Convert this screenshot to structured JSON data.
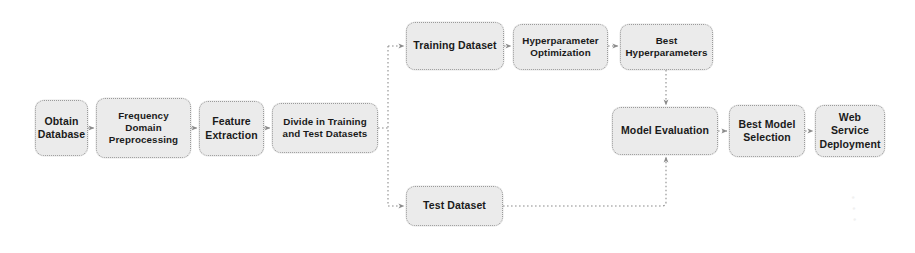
{
  "diagram": {
    "type": "flowchart",
    "canvas": {
      "width": 915,
      "height": 253
    },
    "style": {
      "node_fill": "#ebebeb",
      "node_border": "#9a9a9a",
      "edge_color": "#8c8c8c",
      "text_color": "#1a1a1a",
      "background": "#ffffff",
      "edge_style": "dotted",
      "node_shape": "rounded-rectangle"
    },
    "nodes": [
      {
        "id": "obtain-database",
        "label": "Obtain\nDatabase",
        "x": 35,
        "y": 100,
        "w": 53,
        "h": 56
      },
      {
        "id": "frequency-domain-preprocessing",
        "label": "Frequency\nDomain\nPreprocessing",
        "x": 96,
        "y": 98,
        "w": 95,
        "h": 60
      },
      {
        "id": "feature-extraction",
        "label": "Feature\nExtraction",
        "x": 199,
        "y": 101,
        "w": 65,
        "h": 55
      },
      {
        "id": "divide-in-training-and-test-datasets",
        "label": "Divide in Training\nand Test Datasets",
        "x": 272,
        "y": 103,
        "w": 106,
        "h": 50
      },
      {
        "id": "training-dataset",
        "label": "Training Dataset",
        "x": 406,
        "y": 22,
        "w": 98,
        "h": 48
      },
      {
        "id": "hyperparameter-optimization",
        "label": "Hyperparameter\nOptimization",
        "x": 513,
        "y": 24,
        "w": 95,
        "h": 46
      },
      {
        "id": "best-hyperparameters",
        "label": "Best\nHyperparameters",
        "x": 620,
        "y": 24,
        "w": 93,
        "h": 46
      },
      {
        "id": "model-evaluation",
        "label": "Model Evaluation",
        "x": 612,
        "y": 107,
        "w": 106,
        "h": 48
      },
      {
        "id": "best-model-selection",
        "label": "Best Model\nSelection",
        "x": 729,
        "y": 105,
        "w": 76,
        "h": 52
      },
      {
        "id": "web-service-deployment",
        "label": "Web Service\nDeployment",
        "x": 815,
        "y": 105,
        "w": 70,
        "h": 52
      },
      {
        "id": "test-dataset",
        "label": "Test Dataset",
        "x": 406,
        "y": 186,
        "w": 97,
        "h": 40
      }
    ],
    "edges": [
      {
        "id": "edge-obtain-to-frequency",
        "from": "obtain-database",
        "to": "frequency-domain-preprocessing",
        "kind": "straight"
      },
      {
        "id": "edge-frequency-to-feature",
        "from": "frequency-domain-preprocessing",
        "to": "feature-extraction",
        "kind": "straight"
      },
      {
        "id": "edge-feature-to-divide",
        "from": "feature-extraction",
        "to": "divide-in-training-and-test-datasets",
        "kind": "straight"
      },
      {
        "id": "edge-divide-to-training",
        "from": "divide-in-training-and-test-datasets",
        "to": "training-dataset",
        "kind": "branch-up"
      },
      {
        "id": "edge-divide-to-test",
        "from": "divide-in-training-and-test-datasets",
        "to": "test-dataset",
        "kind": "branch-down"
      },
      {
        "id": "edge-training-to-hyperopt",
        "from": "training-dataset",
        "to": "hyperparameter-optimization",
        "kind": "straight"
      },
      {
        "id": "edge-hyperopt-to-best-hyper",
        "from": "hyperparameter-optimization",
        "to": "best-hyperparameters",
        "kind": "straight"
      },
      {
        "id": "edge-best-hyper-to-model-eval",
        "from": "best-hyperparameters",
        "to": "model-evaluation",
        "kind": "vertical-down"
      },
      {
        "id": "edge-test-to-model-eval",
        "from": "test-dataset",
        "to": "model-evaluation",
        "kind": "elbow-up"
      },
      {
        "id": "edge-model-eval-to-best-model",
        "from": "model-evaluation",
        "to": "best-model-selection",
        "kind": "straight"
      },
      {
        "id": "edge-best-model-to-web-service",
        "from": "best-model-selection",
        "to": "web-service-deployment",
        "kind": "straight"
      }
    ]
  }
}
